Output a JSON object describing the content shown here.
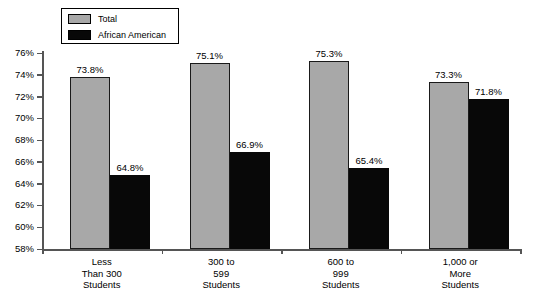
{
  "chart_data": {
    "type": "bar",
    "title": "",
    "subtitle": "",
    "xlabel": "",
    "ylabel": "",
    "ylim": [
      58,
      76
    ],
    "ytick_step": 2,
    "grid": false,
    "legend_position": "top-left",
    "categories": [
      "Less\nThan 300\nStudents",
      "300 to\n599\nStudents",
      "600 to\n999\nStudents",
      "1,000 or\nMore\nStudents"
    ],
    "ytick_labels": [
      "76%",
      "74%",
      "72%",
      "70%",
      "68%",
      "66%",
      "64%",
      "62%",
      "60%",
      "58%"
    ],
    "ytick_values": [
      76,
      74,
      72,
      70,
      68,
      66,
      64,
      62,
      60,
      58
    ],
    "series": [
      {
        "name": "Total",
        "color": "#a8a8a8",
        "values": [
          73.8,
          75.1,
          75.3,
          73.3
        ],
        "labels": [
          "73.8%",
          "75.1%",
          "75.3%",
          "73.3%"
        ]
      },
      {
        "name": "African American",
        "color": "#080808",
        "values": [
          64.8,
          66.9,
          65.4,
          71.8
        ],
        "labels": [
          "64.8%",
          "66.9%",
          "65.4%",
          "71.8%"
        ]
      }
    ]
  },
  "legend": {
    "items": [
      {
        "label": "Total",
        "swatch": "gray-swatch"
      },
      {
        "label": "African American",
        "swatch": "black-swatch"
      }
    ]
  }
}
